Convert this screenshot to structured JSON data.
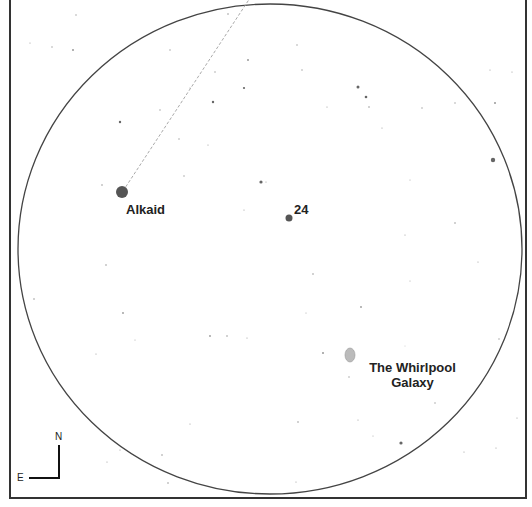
{
  "map": {
    "background": "#ffffff",
    "frame_color": "#333333",
    "field_of_view": {
      "cx": 270,
      "cy": 249,
      "rx": 252,
      "ry": 245,
      "stroke": "#444444"
    },
    "pointer_line": {
      "x1": 123,
      "y1": 191,
      "x2": 250,
      "y2": -2,
      "stroke": "#aaaaaa"
    }
  },
  "labels": {
    "alkaid": "Alkaid",
    "star_24": "24",
    "whirlpool_line1": "The Whirlpool",
    "whirlpool_line2": "Galaxy"
  },
  "compass": {
    "north": "N",
    "east": "E"
  },
  "objects": {
    "alkaid": {
      "x": 122,
      "y": 192,
      "r": 6
    },
    "star_24": {
      "x": 289,
      "y": 218,
      "r": 3.5
    },
    "whirlpool": {
      "x": 350,
      "y": 355,
      "rx": 5,
      "ry": 7
    }
  },
  "stars": [
    [
      228,
      14,
      0.8
    ],
    [
      76,
      15,
      0.7
    ],
    [
      30,
      43,
      0.6
    ],
    [
      52,
      47,
      0.7
    ],
    [
      73,
      50,
      1
    ],
    [
      170,
      50,
      0.7
    ],
    [
      248,
      60,
      1
    ],
    [
      213,
      102,
      1.2
    ],
    [
      244,
      88,
      1.1
    ],
    [
      190,
      88,
      0.6
    ],
    [
      160,
      110,
      0.7
    ],
    [
      120,
      122,
      1.2
    ],
    [
      215,
      72,
      0.7
    ],
    [
      297,
      45,
      0.7
    ],
    [
      302,
      70,
      0.7
    ],
    [
      358,
      87,
      1.5
    ],
    [
      366,
      97,
      1.3
    ],
    [
      369,
      107,
      0.8
    ],
    [
      327,
      107,
      0.6
    ],
    [
      422,
      108,
      0.7
    ],
    [
      382,
      128,
      0.6
    ],
    [
      261,
      182,
      1.6
    ],
    [
      266,
      182,
      0.6
    ],
    [
      102,
      185,
      0.8
    ],
    [
      179,
      139,
      0.7
    ],
    [
      208,
      145,
      0.6
    ],
    [
      184,
      176,
      0.7
    ],
    [
      244,
      210,
      0.6
    ],
    [
      493,
      160,
      2.2
    ],
    [
      495,
      103,
      1
    ],
    [
      490,
      70,
      0.6
    ],
    [
      512,
      72,
      0.6
    ],
    [
      455,
      103,
      0.7
    ],
    [
      106,
      265,
      0.8
    ],
    [
      34,
      299,
      0.8
    ],
    [
      123,
      313,
      0.9
    ],
    [
      135,
      340,
      0.5
    ],
    [
      227,
      336,
      0.8
    ],
    [
      210,
      336,
      0.9
    ],
    [
      247,
      338,
      0.6
    ],
    [
      96,
      354,
      0.6
    ],
    [
      190,
      424,
      0.6
    ],
    [
      162,
      455,
      0.8
    ],
    [
      120,
      450,
      0.6
    ],
    [
      107,
      462,
      0.6
    ],
    [
      168,
      483,
      0.8
    ],
    [
      313,
      274,
      0.8
    ],
    [
      361,
      307,
      0.9
    ],
    [
      323,
      353,
      1
    ],
    [
      306,
      313,
      0.5
    ],
    [
      358,
      420,
      0.6
    ],
    [
      349,
      377,
      0.7
    ],
    [
      401,
      443,
      1.6
    ],
    [
      298,
      422,
      0.8
    ],
    [
      410,
      281,
      0.5
    ],
    [
      499,
      339,
      0.7
    ],
    [
      517,
      418,
      0.6
    ],
    [
      496,
      448,
      0.6
    ],
    [
      464,
      452,
      0.6
    ],
    [
      296,
      482,
      0.6
    ],
    [
      405,
      346,
      0.4
    ],
    [
      435,
      403,
      0.7
    ],
    [
      373,
      436,
      0.5
    ],
    [
      478,
      262,
      0.6
    ],
    [
      405,
      235,
      0.6
    ],
    [
      455,
      223,
      0.8
    ],
    [
      410,
      180,
      0.5
    ]
  ]
}
